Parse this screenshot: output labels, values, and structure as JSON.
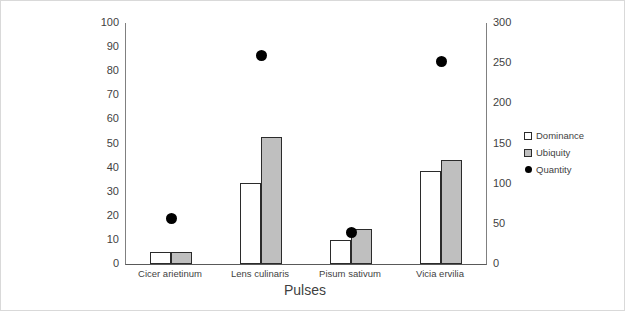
{
  "chart_data": {
    "type": "bar",
    "title": "",
    "subtitle": "",
    "xlabel": "Pulses",
    "ylabel": "",
    "categories": [
      "Cicer arietinum",
      "Lens culinaris",
      "Pisum sativum",
      "Vicia ervilia"
    ],
    "series": [
      {
        "name": "Dominance",
        "type": "bar",
        "axis": "left",
        "color": "#ffffff",
        "border_color": "#2b2b2b",
        "values": [
          5,
          33.5,
          10,
          38.5
        ]
      },
      {
        "name": "Ubiquity",
        "type": "bar",
        "axis": "left",
        "color": "#bfbfbf",
        "border_color": "#2b2b2b",
        "values": [
          5,
          52.5,
          14.5,
          43
        ]
      },
      {
        "name": "Quantity",
        "type": "scatter",
        "axis": "right",
        "color": "#000000",
        "values": [
          57,
          260,
          39,
          252
        ]
      }
    ],
    "left_axis": {
      "min": 0,
      "max": 100,
      "step": 10,
      "ticks": [
        "0",
        "10",
        "20",
        "30",
        "40",
        "50",
        "60",
        "70",
        "80",
        "90",
        "100"
      ]
    },
    "right_axis": {
      "min": 0,
      "max": 300,
      "step": 50,
      "ticks": [
        "0",
        "50",
        "100",
        "150",
        "200",
        "250",
        "300"
      ]
    },
    "grid": false,
    "legend": {
      "position": "right",
      "entries": [
        {
          "label": "Dominance",
          "marker": "white-square"
        },
        {
          "label": "Ubiquity",
          "marker": "gray-square"
        },
        {
          "label": "Quantity",
          "marker": "black-dot"
        }
      ]
    }
  }
}
